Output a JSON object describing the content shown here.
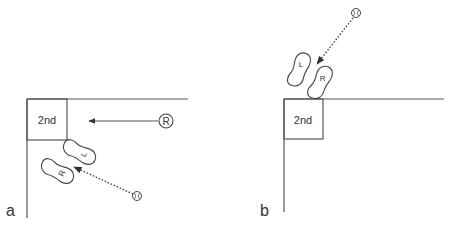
{
  "panels": [
    {
      "label": "a",
      "base_label": "2nd",
      "runner_label": "R",
      "left_foot_label": "L",
      "right_foot_label": "R"
    },
    {
      "label": "b",
      "base_label": "2nd",
      "left_foot_label": "L",
      "right_foot_label": "R"
    }
  ],
  "colors": {
    "line": "#555555",
    "text": "#333333",
    "background": "#ffffff"
  }
}
